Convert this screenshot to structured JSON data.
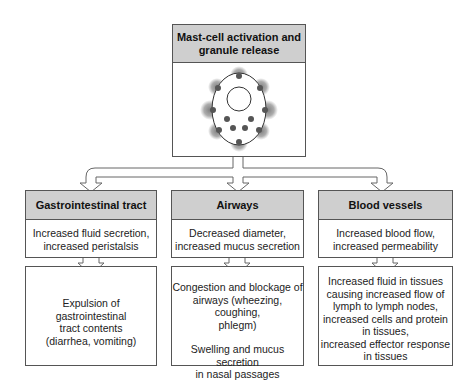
{
  "top": {
    "title_line1": "Mast-cell activation and",
    "title_line2": "granule release",
    "image": "mast-cell-illustration"
  },
  "columns": [
    {
      "title": "Gastrointestinal tract",
      "effect_line1": "Increased fluid secretion,",
      "effect_line2": "increased peristalsis",
      "outcome_lines": [
        "Expulsion of gastrointestinal",
        "tract contents",
        "(diarrhea,  vomiting)"
      ]
    },
    {
      "title": "Airways",
      "effect_line1": "Decreased diameter,",
      "effect_line2": "increased mucus secretion",
      "outcome_lines": [
        "Congestion and blockage of",
        "airways (wheezing, coughing,",
        "phlegm)"
      ],
      "outcome_lines2": [
        "Swelling and mucus secretion",
        "in nasal passages"
      ]
    },
    {
      "title": "Blood vessels",
      "effect_line1": "Increased blood flow,",
      "effect_line2": "increased permeability",
      "outcome_lines": [
        "Increased fluid in tissues",
        "causing increased flow of",
        "lymph to lymph nodes,",
        "increased cells and protein",
        "in tissues,",
        "increased effector response",
        "in tissues"
      ]
    }
  ],
  "colors": {
    "header_fill": "#cfcfcf",
    "border": "#555555",
    "granule": "#555555"
  }
}
